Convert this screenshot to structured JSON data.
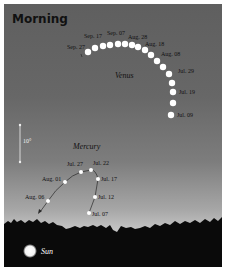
{
  "title": "Morning",
  "venus": {
    "label": "Venus",
    "dates": [
      "Sep. 27",
      "Sep. 17",
      "Sep. 07",
      "Aug. 28",
      "Aug. 18",
      "Aug. 08",
      "Jul. 29",
      "Jul. 19",
      "Jul. 09"
    ]
  },
  "mercury": {
    "label": "Mercury",
    "dates": [
      "Aug. 06",
      "Aug. 01",
      "Jul. 27",
      "Jul. 22",
      "Jul. 17",
      "Jul. 12",
      "Jul. 07"
    ]
  },
  "scale": {
    "label": "10°"
  },
  "sun": {
    "label": "Sun"
  },
  "colors": {
    "sky_top": "#5f5f5f",
    "sky_horizon": "#c4c4c4",
    "ground": "#0a0a0a",
    "dot": "#ffffff"
  }
}
